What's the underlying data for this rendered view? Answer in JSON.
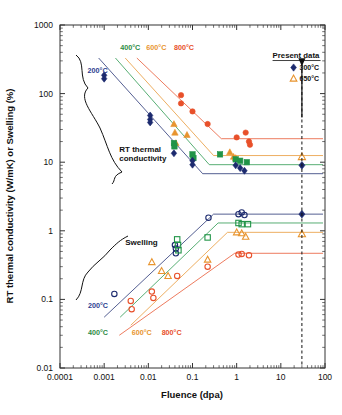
{
  "figure": {
    "background": "#ffffff",
    "plot_box": {
      "left": 60,
      "right": 325,
      "top": 25,
      "bottom": 368
    }
  },
  "chart_data": {
    "type": "scatter",
    "title": "",
    "xlabel": "Fluence (dpa)",
    "ylabel": "RT thermal conductivity (W/mK) or Swelling (%)",
    "xscale": "log",
    "yscale": "log",
    "xlim": [
      0.0001,
      100
    ],
    "ylim": [
      0.01,
      1000
    ],
    "grid": false,
    "xticks": [
      "0.0001",
      "0.001",
      "0.01",
      "0.1",
      "1",
      "10",
      "100"
    ],
    "xtick_values": [
      0.0001,
      0.001,
      0.01,
      0.1,
      1,
      10,
      100
    ],
    "yticks": [
      "1000",
      "100",
      "10",
      "1",
      "0.1",
      "0.01"
    ],
    "ytick_values": [
      1000,
      100,
      10,
      1,
      0.1,
      0.01
    ],
    "annotations": [
      {
        "text": "RT thermal conductivity",
        "x": 0.0022,
        "y": 14,
        "name": "annotation-rt-thermal-conductivity"
      },
      {
        "text": "Swelling",
        "x": 0.003,
        "y": 0.62,
        "name": "annotation-swelling"
      },
      {
        "text": "Present data",
        "x": 6.5,
        "y": 330,
        "name": "annotation-present-data"
      }
    ],
    "temperature_labels_upper": [
      {
        "text": "200°C",
        "color": "#2c3d8f",
        "x": 0.00042,
        "y": 200
      },
      {
        "text": "400°C",
        "color": "#2e8b45",
        "x": 0.0023,
        "y": 430
      },
      {
        "text": "600°C",
        "color": "#e8942e",
        "x": 0.009,
        "y": 430
      },
      {
        "text": "800°C",
        "color": "#e8502a",
        "x": 0.038,
        "y": 430
      }
    ],
    "temperature_labels_lower": [
      {
        "text": "200°C",
        "color": "#2c3d8f",
        "x": 0.00043,
        "y": 0.075
      },
      {
        "text": "400°C",
        "color": "#2e8b45",
        "x": 0.00043,
        "y": 0.03
      },
      {
        "text": "600°C",
        "color": "#e8942e",
        "x": 0.0042,
        "y": 0.03
      },
      {
        "text": "800°C",
        "color": "#e8502a",
        "x": 0.02,
        "y": 0.03
      }
    ],
    "series": [
      {
        "name": "800°C conductivity",
        "color": "#e8502a",
        "marker": "circle",
        "filled": true,
        "group": "conductivity",
        "points": [
          [
            0.055,
            95
          ],
          [
            0.055,
            72
          ],
          [
            0.1,
            55
          ],
          [
            0.22,
            36
          ],
          [
            1.0,
            23
          ],
          [
            1.6,
            27
          ],
          [
            1.9,
            20
          ],
          [
            2.0,
            18
          ]
        ],
        "trend": {
          "knee_x": 0.45,
          "start_x": 0.0055,
          "start_y": 330,
          "plateau_y": 22
        }
      },
      {
        "name": "600°C conductivity",
        "color": "#e8942e",
        "marker": "triangle",
        "filled": true,
        "group": "conductivity",
        "points": [
          [
            0.038,
            36
          ],
          [
            0.04,
            27
          ],
          [
            0.042,
            19
          ],
          [
            0.075,
            25
          ],
          [
            0.7,
            14
          ],
          [
            0.85,
            12
          ],
          [
            0.95,
            11.5
          ]
        ],
        "trend": {
          "knee_x": 0.3,
          "start_x": 0.003,
          "start_y": 330,
          "plateau_y": 12.5
        }
      },
      {
        "name": "400°C conductivity",
        "color": "#219447",
        "marker": "square",
        "filled": true,
        "group": "conductivity",
        "points": [
          [
            0.038,
            19
          ],
          [
            0.039,
            17
          ],
          [
            0.1,
            13
          ],
          [
            0.105,
            11.5
          ],
          [
            0.42,
            13
          ],
          [
            0.95,
            11
          ],
          [
            1.2,
            10.5
          ],
          [
            1.7,
            10
          ]
        ],
        "trend": {
          "knee_x": 0.24,
          "start_x": 0.0018,
          "start_y": 330,
          "plateau_y": 9.2
        }
      },
      {
        "name": "200°C conductivity",
        "color": "#1c2a6e",
        "marker": "diamond",
        "filled": true,
        "group": "conductivity",
        "points": [
          [
            0.001,
            185
          ],
          [
            0.001,
            165
          ],
          [
            0.011,
            48
          ],
          [
            0.011,
            42
          ],
          [
            0.011,
            38
          ],
          [
            0.038,
            13.5
          ],
          [
            0.1,
            10.5
          ],
          [
            0.1,
            9.2
          ],
          [
            0.95,
            9.0
          ],
          [
            1.2,
            8.2
          ],
          [
            1.5,
            7.5
          ]
        ],
        "trend": {
          "knee_x": 0.17,
          "start_x": 0.00075,
          "start_y": 330,
          "plateau_y": 6.8
        }
      },
      {
        "name": "200°C swelling",
        "color": "#1c2a6e",
        "marker": "circle",
        "filled": false,
        "group": "swelling",
        "points": [
          [
            0.0017,
            0.12
          ],
          [
            0.04,
            0.62
          ],
          [
            0.042,
            0.55
          ],
          [
            0.042,
            0.47
          ],
          [
            0.23,
            1.55
          ],
          [
            1.1,
            1.75
          ],
          [
            1.3,
            1.85
          ],
          [
            1.5,
            1.7
          ]
        ],
        "trend": {
          "knee_x": 0.3,
          "start_x": 0.001,
          "start_y": 0.055,
          "plateau_y": 1.75
        }
      },
      {
        "name": "400°C swelling",
        "color": "#219447",
        "marker": "square",
        "filled": false,
        "group": "swelling",
        "points": [
          [
            0.045,
            0.75
          ],
          [
            0.047,
            0.62
          ],
          [
            0.048,
            0.52
          ],
          [
            0.22,
            0.8
          ],
          [
            1.1,
            1.3
          ],
          [
            1.3,
            1.25
          ],
          [
            1.8,
            1.25
          ]
        ],
        "trend": {
          "knee_x": 0.38,
          "start_x": 0.0023,
          "start_y": 0.055,
          "plateau_y": 1.3
        }
      },
      {
        "name": "600°C swelling",
        "color": "#e8942e",
        "marker": "triangle",
        "filled": false,
        "group": "swelling",
        "points": [
          [
            0.012,
            0.35
          ],
          [
            0.02,
            0.26
          ],
          [
            0.028,
            0.22
          ],
          [
            0.22,
            0.38
          ],
          [
            1.0,
            0.95
          ],
          [
            1.3,
            0.92
          ],
          [
            1.6,
            0.82
          ]
        ],
        "trend": {
          "knee_x": 0.62,
          "start_x": 0.004,
          "start_y": 0.042,
          "plateau_y": 0.95
        }
      },
      {
        "name": "800°C swelling",
        "color": "#e8502a",
        "marker": "circle",
        "filled": false,
        "group": "swelling",
        "points": [
          [
            0.004,
            0.095
          ],
          [
            0.0042,
            0.072
          ],
          [
            0.012,
            0.13
          ],
          [
            0.013,
            0.105
          ],
          [
            0.045,
            0.22
          ],
          [
            0.22,
            0.3
          ],
          [
            1.1,
            0.45
          ],
          [
            1.3,
            0.46
          ],
          [
            1.9,
            0.44
          ]
        ],
        "trend": {
          "knee_x": 0.9,
          "start_x": 0.0022,
          "start_y": 0.03,
          "plateau_y": 0.47
        }
      },
      {
        "name": "Present data 300°C",
        "color": "#1c2a6e",
        "marker": "diamond",
        "filled": true,
        "group": "present",
        "points": [
          [
            30,
            9.0
          ],
          [
            30,
            1.75
          ]
        ]
      },
      {
        "name": "Present data 650°C",
        "color": "#e8942e",
        "marker": "triangle",
        "filled": false,
        "group": "present",
        "points": [
          [
            30,
            12.0
          ],
          [
            30,
            0.9
          ]
        ]
      }
    ],
    "present_data_marker_line": {
      "x": 30,
      "style": "dashed",
      "color": "#111111"
    },
    "arrow": {
      "x": 30,
      "y_from": 260,
      "y_to": 45
    }
  },
  "legend": {
    "position": "top-right",
    "title": "Present data",
    "entries": [
      {
        "label": "300°C",
        "marker": "diamond",
        "color": "#1c2a6e",
        "filled": true
      },
      {
        "label": "650°C",
        "marker": "triangle",
        "color": "#e8942e",
        "filled": false
      }
    ]
  }
}
